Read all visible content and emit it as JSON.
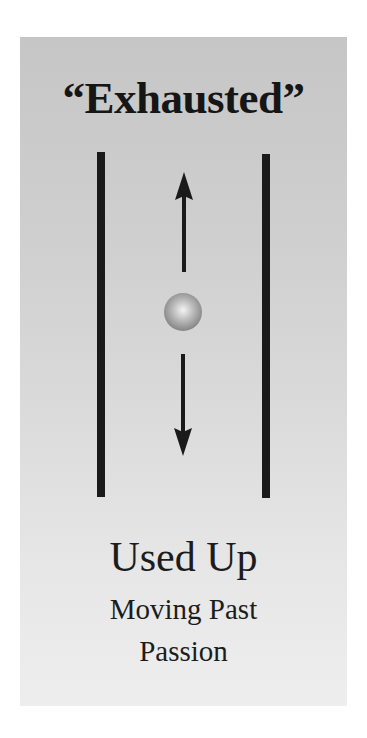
{
  "panel": {
    "title": "“Exhausted”",
    "caption": {
      "main": "Used Up",
      "sub_line_1": "Moving Past",
      "sub_line_2": "Passion"
    },
    "diagram": {
      "rails": [
        "left-boundary-line",
        "right-boundary-line"
      ],
      "center_object": "sphere",
      "arrows": [
        "up-arrow",
        "down-arrow"
      ]
    },
    "colors": {
      "background_top": "#c6c6c6",
      "background_bottom": "#eeeeee",
      "ink": "#1a1a1a"
    }
  }
}
